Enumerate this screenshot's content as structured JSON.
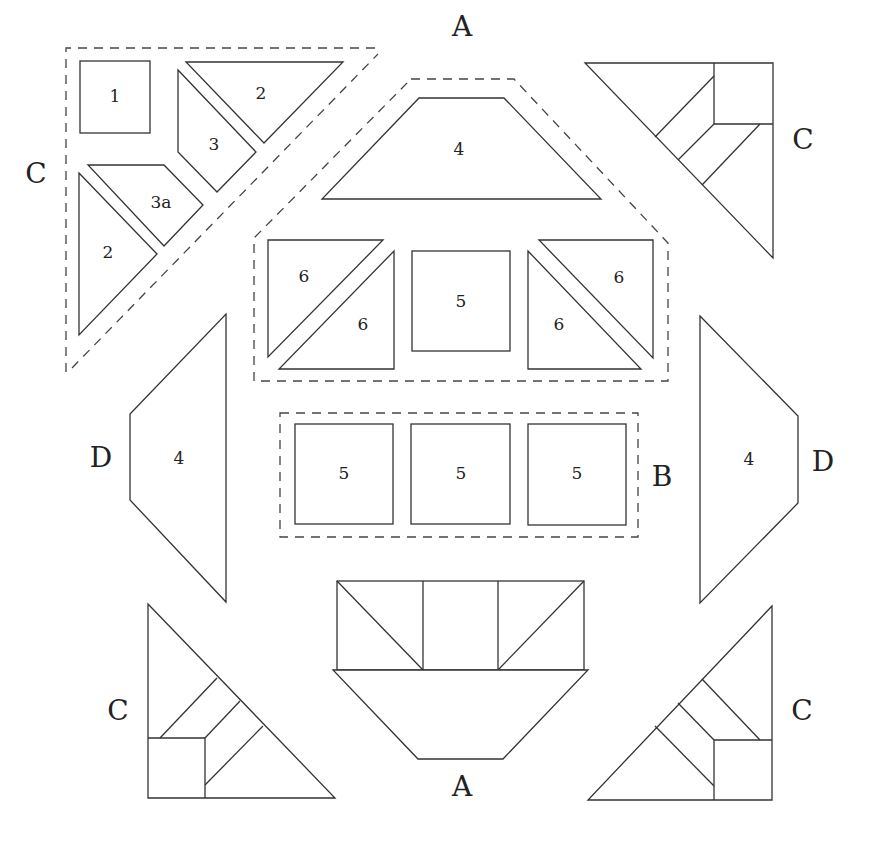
{
  "diagram": {
    "block_labels": {
      "a_top": "A",
      "a_bottom": "A",
      "b": "B",
      "c_top_left": "C",
      "c_top_right": "C",
      "c_bottom_left": "C",
      "c_bottom_right": "C",
      "d_left": "D",
      "d_right": "D"
    },
    "unit_c": {
      "pieces": [
        {
          "id": "square",
          "label": "1"
        },
        {
          "id": "triangle-top",
          "label": "2"
        },
        {
          "id": "trapezoid",
          "label": "3"
        },
        {
          "id": "trapezoid-a",
          "label": "3a"
        },
        {
          "id": "triangle-left",
          "label": "2"
        }
      ]
    },
    "unit_a_top": {
      "pieces": [
        {
          "id": "trapezoid",
          "label": "4"
        },
        {
          "id": "hst-left-upper",
          "label": "6"
        },
        {
          "id": "hst-left-lower",
          "label": "6"
        },
        {
          "id": "square",
          "label": "5"
        },
        {
          "id": "hst-right-upper",
          "label": "6"
        },
        {
          "id": "hst-right-lower",
          "label": "6"
        }
      ]
    },
    "unit_b": {
      "pieces": [
        {
          "id": "square-1",
          "label": "5"
        },
        {
          "id": "square-2",
          "label": "5"
        },
        {
          "id": "square-3",
          "label": "5"
        }
      ]
    },
    "unit_d_left": {
      "label": "4"
    },
    "unit_d_right": {
      "label": "4"
    }
  }
}
